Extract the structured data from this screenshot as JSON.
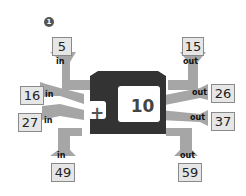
{
  "badge": "1",
  "machine": {
    "operation_symbol": "+",
    "operand": "10",
    "body_color": "#333333",
    "chute_color": "#a6a6a6"
  },
  "inputs": [
    {
      "value": "5",
      "label": "in"
    },
    {
      "value": "16",
      "label": "in"
    },
    {
      "value": "27",
      "label": "in"
    },
    {
      "value": "49",
      "label": "in"
    }
  ],
  "outputs": [
    {
      "value": "15",
      "label": "out"
    },
    {
      "value": "26",
      "label": "out"
    },
    {
      "value": "37",
      "label": "out"
    },
    {
      "value": "59",
      "label": "out"
    }
  ]
}
